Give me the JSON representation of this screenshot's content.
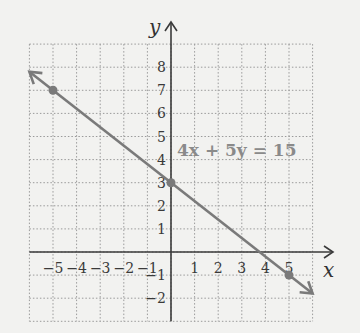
{
  "chart_data": {
    "type": "line",
    "title": "",
    "xlabel": "x",
    "ylabel": "y",
    "xlim": [
      -6,
      6
    ],
    "ylim": [
      -3,
      9
    ],
    "grid": true,
    "x_ticks": [
      -5,
      -4,
      -3,
      -2,
      -1,
      1,
      2,
      3,
      4,
      5
    ],
    "y_ticks": [
      -2,
      -1,
      1,
      2,
      3,
      4,
      5,
      6,
      7,
      8
    ],
    "x_tick_labels": [
      "−5",
      "−4",
      "−3",
      "−2",
      "−1",
      "1",
      "2",
      "3",
      "4",
      "5"
    ],
    "y_tick_labels": [
      "−2",
      "−1",
      "1",
      "2",
      "3",
      "4",
      "5",
      "6",
      "7",
      "8"
    ],
    "series": [
      {
        "name": "4x + 5y = 15",
        "equation": "4x + 5y = 15",
        "slope": -0.8,
        "intercept": 3,
        "points": [
          {
            "x": -5,
            "y": 7
          },
          {
            "x": 0,
            "y": 3
          },
          {
            "x": 5,
            "y": -1
          }
        ],
        "line_extent": {
          "x_start": -6,
          "y_start": 7.8,
          "x_end": 6,
          "y_end": -1.8
        },
        "color": "#7a7a7a"
      }
    ],
    "annotations": [
      {
        "text": "4x + 5y = 15",
        "x": 0.3,
        "y": 4.3
      }
    ]
  },
  "labels": {
    "x_axis": "x",
    "y_axis": "y",
    "equation": "4x + 5y = 15"
  },
  "colors": {
    "background": "#f2f2f0",
    "grid": "#9a9a9a",
    "axis": "#3a3a3a",
    "line": "#7a7a7a",
    "equation": "#8a8a8a"
  }
}
